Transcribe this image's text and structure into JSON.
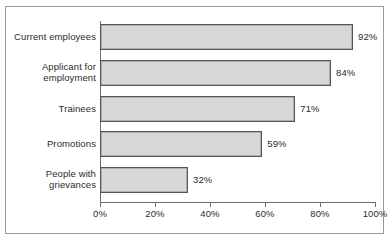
{
  "chart_data": {
    "type": "bar",
    "orientation": "horizontal",
    "title": "",
    "xlabel": "",
    "ylabel": "",
    "categories": [
      "Current employees",
      "Applicant for\nemployment",
      "Trainees",
      "Promotions",
      "People with\ngrievances"
    ],
    "values": [
      92,
      71,
      59,
      32,
      84
    ],
    "series": [
      {
        "name": "Percent",
        "values": [
          92,
          84,
          71,
          59,
          32
        ]
      }
    ],
    "data_labels": [
      "92%",
      "84%",
      "71%",
      "59%",
      "32%"
    ],
    "xlim": [
      0,
      100
    ],
    "xticks": [
      0,
      20,
      40,
      60,
      80,
      100
    ],
    "xtick_labels": [
      "0%",
      "20%",
      "40%",
      "60%",
      "80%",
      "100%"
    ],
    "grid": false,
    "legend": null,
    "bar_fill_color": "#d7d7d7",
    "bar_edge_color": "#555555",
    "axis_color": "#6e6e6e",
    "text_color": "#2b2b2b",
    "frame_color": "#9a9a9a",
    "background_color": "#ffffff"
  },
  "bars": [
    {
      "label": "Current employees",
      "value_label": "92%",
      "value": 92,
      "top": 24,
      "height": 26
    },
    {
      "label": "Applicant for\nemployment",
      "value_label": "84%",
      "value": 84,
      "top": 60,
      "height": 26
    },
    {
      "label": "Trainees",
      "value_label": "71%",
      "value": 71,
      "top": 96,
      "height": 26
    },
    {
      "label": "Promotions",
      "value_label": "59%",
      "value": 59,
      "top": 131,
      "height": 26
    },
    {
      "label": "People with\ngrievances",
      "value_label": "32%",
      "value": 32,
      "top": 167,
      "height": 26
    }
  ],
  "xticks": [
    {
      "label": "0%",
      "value": 0
    },
    {
      "label": "20%",
      "value": 20
    },
    {
      "label": "40%",
      "value": 40
    },
    {
      "label": "60%",
      "value": 60
    },
    {
      "label": "80%",
      "value": 80
    },
    {
      "label": "100%",
      "value": 100
    }
  ]
}
